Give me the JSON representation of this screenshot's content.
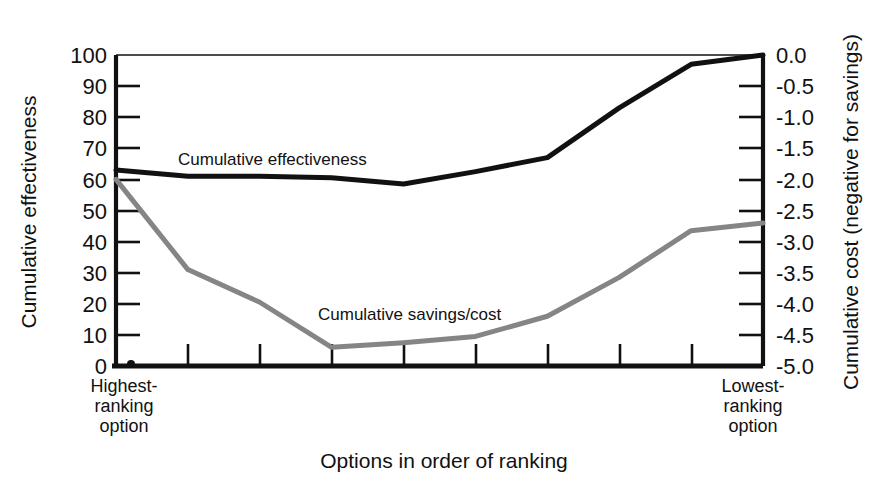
{
  "chart_data": {
    "type": "line",
    "title": "",
    "xlabel": "Options in order of ranking",
    "ylabel": "Cumulative effectiveness",
    "y2label": "Cumulative cost (negative for savings)",
    "grid": false,
    "legend_position": "inline-annotation",
    "x": [
      0,
      1,
      2,
      3,
      4,
      5,
      6,
      7,
      8,
      9
    ],
    "ylim": [
      0,
      100
    ],
    "y2lim": [
      -5.0,
      0.0
    ],
    "yticks": [
      "0",
      "10",
      "20",
      "30",
      "40",
      "50",
      "60",
      "70",
      "80",
      "90",
      "100"
    ],
    "ytick_values": [
      0,
      10,
      20,
      30,
      40,
      50,
      60,
      70,
      80,
      90,
      100
    ],
    "y2ticks": [
      "-5.0",
      "-4.5",
      "-4.0",
      "-3.5",
      "-3.0",
      "-2.5",
      "-2.0",
      "-1.5",
      "-1.0",
      "-0.5",
      "0.0"
    ],
    "y2tick_values": [
      -5.0,
      -4.5,
      -4.0,
      -3.5,
      -3.0,
      -2.5,
      -2.0,
      -1.5,
      -1.0,
      -0.5,
      0.0
    ],
    "xticklabels": [
      "Highest-\nranking\noption",
      "",
      "",
      "",
      "",
      "",
      "",
      "",
      "",
      "Lowest-\nranking\noption"
    ],
    "x_left_label_lines": [
      "Highest-",
      "ranking",
      "option"
    ],
    "x_right_label_lines": [
      "Lowest-",
      "ranking",
      "option"
    ],
    "series": [
      {
        "name": "Cumulative effectiveness",
        "axis": "left",
        "color": "#111111",
        "width": 5,
        "annotation": "Cumulative effectiveness",
        "values": [
          63,
          61,
          61,
          60.5,
          58.5,
          62.5,
          67,
          83,
          97,
          100
        ]
      },
      {
        "name": "Cumulative savings/cost",
        "axis": "left",
        "color": "#858585",
        "width": 5,
        "annotation": "Cumulative savings/cost",
        "values": [
          60,
          31,
          20.5,
          6,
          7.5,
          9.5,
          16,
          28.5,
          43.5,
          46
        ]
      }
    ]
  },
  "annotations": {
    "effectiveness_label": "Cumulative effectiveness",
    "savings_label": "Cumulative savings/cost"
  }
}
